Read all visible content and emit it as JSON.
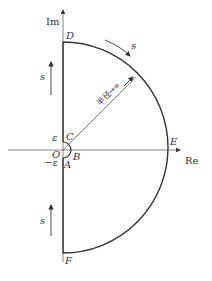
{
  "diagram": {
    "type": "nyquist-contour",
    "axes": {
      "imag_label": "Im",
      "real_label": "Re"
    },
    "points": {
      "D": "D",
      "C": "C",
      "O": "O",
      "B": "B",
      "A": "A",
      "E": "E",
      "F": "F"
    },
    "epsilon_pos": "ε",
    "epsilon_neg": "−ε",
    "direction_labels": {
      "upper_axis": "s",
      "lower_axis": "s",
      "arc": "s"
    },
    "radius_label": "半径→∞",
    "colors": {
      "stroke": "#333333",
      "axis": "#555555",
      "background": "#ffffff"
    }
  }
}
